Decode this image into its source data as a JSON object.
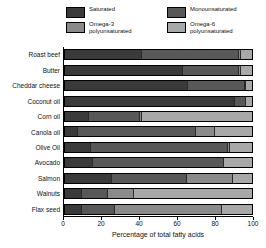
{
  "chart_data": {
    "type": "bar",
    "orientation": "horizontal",
    "stacked": true,
    "title": "",
    "xlabel": "Percentage of total fatty acids",
    "ylabel": "",
    "xlim": [
      0,
      100
    ],
    "xticks": [
      0,
      20,
      40,
      60,
      80,
      100
    ],
    "grid": false,
    "legend_position": "top",
    "categories": [
      "Roast beef",
      "Butter",
      "Cheddar cheese",
      "Coconut oil",
      "Corn oil",
      "Canola oil",
      "Olive Oil",
      "Avocado",
      "Salmon",
      "Walnuts",
      "Flax seed"
    ],
    "series": [
      {
        "name": "Saturated",
        "color": "#3a3a3a",
        "values": [
          41,
          63,
          66,
          91,
          13,
          7,
          14,
          15,
          25,
          9,
          9
        ]
      },
      {
        "name": "Monounsaturated",
        "color": "#585858",
        "values": [
          52,
          30,
          30,
          6,
          27,
          63,
          73,
          70,
          40,
          14,
          18
        ]
      },
      {
        "name": "Omega-3 polyunsaturated",
        "color": "#8a8a8a",
        "values": [
          1,
          1,
          1,
          0,
          1,
          10,
          1,
          0,
          25,
          14,
          57
        ]
      },
      {
        "name": "Omega-6 polyunsaturated",
        "color": "#a8a8a8",
        "values": [
          6,
          6,
          3,
          3,
          59,
          20,
          12,
          15,
          10,
          63,
          16
        ]
      }
    ]
  },
  "legend": {
    "items": [
      {
        "label": "Saturated",
        "color": "#3a3a3a"
      },
      {
        "label": "Monounsaturated",
        "color": "#585858"
      },
      {
        "label": "Omega-3\npolyunsaturated",
        "color": "#8a8a8a"
      },
      {
        "label": "Omega-6\npolyunsaturated",
        "color": "#a8a8a8"
      }
    ]
  }
}
